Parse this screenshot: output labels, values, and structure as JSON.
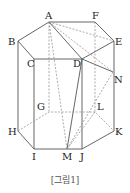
{
  "figure": {
    "caption": "[그림1]",
    "vertices": {
      "A": {
        "label": "A",
        "x": 49,
        "y": 22
      },
      "F": {
        "label": "F",
        "x": 95,
        "y": 22
      },
      "B": {
        "label": "B",
        "x": 18,
        "y": 41
      },
      "E": {
        "label": "E",
        "x": 114,
        "y": 41
      },
      "C": {
        "label": "C",
        "x": 34,
        "y": 59
      },
      "D": {
        "label": "D",
        "x": 82,
        "y": 59
      },
      "N": {
        "label": "N",
        "x": 113,
        "y": 72
      },
      "G": {
        "label": "G",
        "x": 49,
        "y": 112
      },
      "L": {
        "label": "L",
        "x": 95,
        "y": 112
      },
      "H": {
        "label": "H",
        "x": 18,
        "y": 131
      },
      "K": {
        "label": "K",
        "x": 114,
        "y": 131
      },
      "I": {
        "label": "I",
        "x": 34,
        "y": 149
      },
      "M": {
        "label": "M",
        "x": 67,
        "y": 149
      },
      "J": {
        "label": "J",
        "x": 82,
        "y": 149
      }
    },
    "line_color": "#555555",
    "dash_color": "#888888"
  }
}
